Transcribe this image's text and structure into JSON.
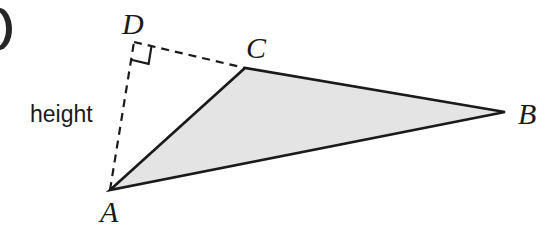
{
  "figure": {
    "background_color": "#ffffff",
    "width": 554,
    "height": 227,
    "stroke_color": "#1a1a1a",
    "fill_color": "#e4e4e4",
    "labels": {
      "vertex_a": "A",
      "vertex_b": "B",
      "vertex_c": "C",
      "vertex_d": "D",
      "height": "height"
    },
    "points": {
      "A": {
        "x": 110,
        "y": 190
      },
      "B": {
        "x": 505,
        "y": 112
      },
      "C": {
        "x": 245,
        "y": 68
      },
      "D": {
        "x": 134,
        "y": 42
      }
    },
    "label_positions": {
      "A": {
        "x": 100,
        "y": 222
      },
      "B": {
        "x": 518,
        "y": 124
      },
      "C": {
        "x": 246,
        "y": 58
      },
      "D": {
        "x": 122,
        "y": 34
      },
      "height": {
        "x": 30,
        "y": 122
      }
    },
    "edges": [
      {
        "name": "side-ac",
        "from": "A",
        "to": "C",
        "style": "solid"
      },
      {
        "name": "side-cb",
        "from": "C",
        "to": "B",
        "style": "solid"
      },
      {
        "name": "side-ba",
        "from": "B",
        "to": "A",
        "style": "solid"
      },
      {
        "name": "altitude-ad",
        "from": "A",
        "to": "D",
        "style": "dashed"
      },
      {
        "name": "extension-dc",
        "from": "D",
        "to": "C",
        "style": "dashed"
      }
    ],
    "right_angle": {
      "at": "D",
      "marker": "square",
      "size": 18
    },
    "edge_artifact": {
      "name": "page-edge-crescent",
      "color": "#262626",
      "x": -14,
      "y": 8,
      "width": 26,
      "height": 42
    }
  }
}
